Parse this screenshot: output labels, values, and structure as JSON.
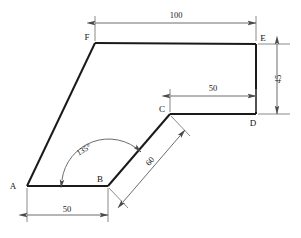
{
  "drawing": {
    "title": "Hexagonal plate outline with dimensions",
    "background_color": "#ffffff",
    "outline_color": "#1a1a1a",
    "dimension_color": "#6d6d6d",
    "text_color": "#1a1a1a",
    "units": "mm"
  },
  "vertices": [
    {
      "label": "A",
      "x": 27,
      "y": 186,
      "label_x": 13,
      "label_y": 189
    },
    {
      "label": "B",
      "x": 108,
      "y": 186,
      "label_x": 98,
      "label_y": 182
    },
    {
      "label": "C",
      "x": 170,
      "y": 114,
      "label_x": 161,
      "label_y": 113
    },
    {
      "label": "D",
      "x": 256,
      "y": 114,
      "label_x": 251,
      "label_y": 127
    },
    {
      "label": "E",
      "x": 256,
      "y": 44,
      "label_x": 260,
      "label_y": 41
    },
    {
      "label": "F",
      "x": 95,
      "y": 43,
      "label_x": 85,
      "label_y": 40
    }
  ],
  "edges": [
    {
      "name": "edge-a-b",
      "from": "A",
      "to": "B"
    },
    {
      "name": "edge-b-c",
      "from": "B",
      "to": "C"
    },
    {
      "name": "edge-c-d",
      "from": "C",
      "to": "D"
    },
    {
      "name": "edge-d-e",
      "from": "D",
      "to": "E"
    },
    {
      "name": "edge-e-f",
      "from": "E",
      "to": "F"
    },
    {
      "name": "edge-f-a",
      "from": "F",
      "to": "A"
    }
  ],
  "dimensions": [
    {
      "name": "dimension-top-100",
      "value": "100",
      "between": [
        "F",
        "E"
      ],
      "orientation": "horizontal",
      "rotation": 0,
      "text_x": 176,
      "text_y": 18
    },
    {
      "name": "dimension-right-45",
      "value": "45",
      "between": [
        "E",
        "D"
      ],
      "orientation": "vertical",
      "rotation": -90,
      "text_x": 281,
      "text_y": 79
    },
    {
      "name": "dimension-middle-50",
      "value": "50",
      "between": [
        "C",
        "D"
      ],
      "orientation": "horizontal",
      "rotation": 0,
      "text_x": 213,
      "text_y": 91
    },
    {
      "name": "dimension-bottom-50",
      "value": "50",
      "between": [
        "A",
        "B"
      ],
      "orientation": "horizontal",
      "rotation": 0,
      "text_x": 67,
      "text_y": 213
    },
    {
      "name": "dimension-diagonal-60",
      "value": "60",
      "between": [
        "B",
        "C"
      ],
      "orientation": "diagonal",
      "rotation": -49,
      "text_x": 152,
      "text_y": 163
    }
  ],
  "angles": [
    {
      "name": "angle-at-b-135",
      "value": "135°",
      "vertex": "B",
      "from_ray": "B-A",
      "to_ray": "B-C",
      "text_x": 80,
      "text_y": 153
    }
  ]
}
